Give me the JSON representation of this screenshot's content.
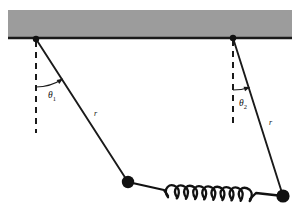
{
  "figure": {
    "background_color": "#ffffff",
    "width": 304,
    "height": 216
  },
  "ceiling": {
    "name": "support-bar",
    "fill_color": "#9c9c9c",
    "edge_color": "#1a1a1a",
    "x": 8,
    "y": 10,
    "width": 284,
    "height": 28
  },
  "pivots": [
    {
      "label": "left-pivot",
      "x": 36,
      "y": 39,
      "radius": 3.2
    },
    {
      "label": "right-pivot",
      "x": 233,
      "y": 38,
      "radius": 3.2
    }
  ],
  "vertical_reference_lines": [
    {
      "label": "left-vertical-dashed",
      "x": 36,
      "y1": 41,
      "y2": 133,
      "dash": "6,5"
    },
    {
      "label": "right-vertical-dashed",
      "x": 233,
      "y1": 40,
      "y2": 126,
      "dash": "6,5"
    }
  ],
  "strings": [
    {
      "label": "left-string",
      "length_label": "r",
      "from_x": 36,
      "from_y": 39,
      "to_x": 128,
      "to_y": 182,
      "label_x": 94,
      "label_y": 116
    },
    {
      "label": "right-string",
      "length_label": "r",
      "from_x": 233,
      "from_y": 38,
      "to_x": 283,
      "to_y": 196,
      "label_x": 269,
      "label_y": 125
    }
  ],
  "angles": [
    {
      "name": "theta-1",
      "symbol": "θ",
      "subscript": "1",
      "label_x": 48,
      "label_y": 98,
      "arc_radius": 48,
      "pivot_x": 36,
      "pivot_y": 39,
      "start_deg": 90,
      "end_deg": 57
    },
    {
      "name": "theta-2",
      "symbol": "θ",
      "subscript": "2",
      "label_x": 239,
      "label_y": 106,
      "arc_radius": 52,
      "pivot_x": 233,
      "pivot_y": 38,
      "start_deg": 90,
      "end_deg": 72
    }
  ],
  "masses": [
    {
      "label": "left-mass",
      "x": 128,
      "y": 182,
      "radius": 6.2,
      "color": "#111111"
    },
    {
      "label": "right-mass",
      "x": 283,
      "y": 196,
      "radius": 6.6,
      "color": "#111111"
    }
  ],
  "spring": {
    "name": "coupling-spring",
    "coil_count": 9,
    "start_x": 168,
    "start_y": 192,
    "end_x": 250,
    "end_y": 195,
    "coil_radius_x": 4.6,
    "coil_radius_y": 12.5,
    "lead_left_from_x": 128,
    "lead_left_from_y": 182,
    "lead_right_to_x": 283,
    "lead_right_to_y": 196,
    "stroke_color": "#111111",
    "stroke_width": 2.3
  },
  "style": {
    "line_color": "#1a1a1a",
    "string_width": 1.9,
    "dash_width": 2.0
  }
}
